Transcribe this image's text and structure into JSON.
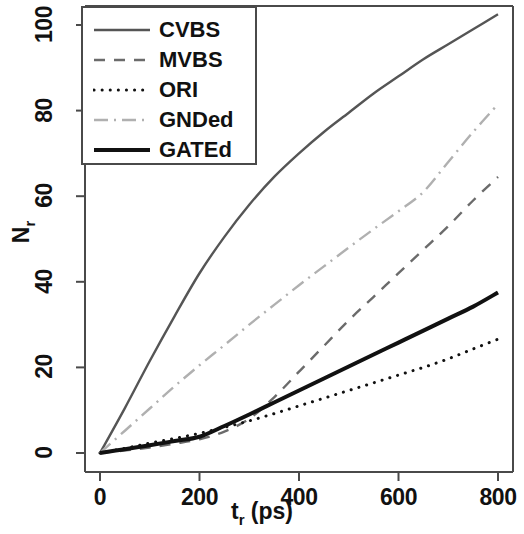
{
  "chart_data": {
    "type": "line",
    "title": "",
    "xlabel": "t_r (ps)",
    "ylabel": "N_r",
    "xlabel_main": "t",
    "xlabel_sub": "r",
    "xlabel_unit": " (ps)",
    "ylabel_main": "N",
    "ylabel_sub": "r",
    "xlim": [
      -30,
      830
    ],
    "ylim": [
      -4,
      106
    ],
    "xticks": [
      0,
      200,
      400,
      600,
      800
    ],
    "yticks": [
      0,
      20,
      40,
      60,
      80,
      100
    ],
    "xtick_labels": [
      "0",
      "200",
      "400",
      "600",
      "800"
    ],
    "ytick_labels": [
      "0",
      "20",
      "40",
      "60",
      "80",
      "100"
    ],
    "grid": false,
    "legend_position": "top-left",
    "x": [
      0,
      50,
      100,
      150,
      200,
      250,
      300,
      350,
      400,
      450,
      500,
      550,
      600,
      650,
      700,
      750,
      800
    ],
    "series": [
      {
        "name": "CVBS",
        "style": "solid-thin",
        "color": "#555555",
        "values": [
          0,
          10.5,
          21.5,
          32.0,
          42.0,
          50.5,
          58.0,
          64.5,
          70.0,
          75.0,
          79.5,
          84.0,
          88.0,
          92.0,
          95.5,
          99.0,
          102.5
        ]
      },
      {
        "name": "MVBS",
        "style": "dashed",
        "color": "#6b6b6b",
        "values": [
          0,
          0.6,
          1.3,
          2.2,
          3.2,
          5.0,
          8.0,
          13.0,
          19.0,
          25.0,
          31.0,
          36.5,
          42.0,
          47.5,
          53.0,
          59.0,
          64.5
        ]
      },
      {
        "name": "ORI",
        "style": "dotted",
        "color": "#111111",
        "values": [
          0,
          1.1,
          2.3,
          3.4,
          4.6,
          6.0,
          7.5,
          9.2,
          11.0,
          12.8,
          14.6,
          16.4,
          18.2,
          20.0,
          22.0,
          24.3,
          26.6
        ]
      },
      {
        "name": "GNDed",
        "style": "dashdot",
        "color": "#b0b0b0",
        "values": [
          0,
          5.2,
          10.4,
          15.6,
          20.5,
          25.2,
          30.0,
          34.6,
          39.2,
          43.6,
          48.0,
          52.3,
          56.5,
          61.0,
          68.0,
          75.0,
          81.5
        ]
      },
      {
        "name": "GATEd",
        "style": "solid-thick",
        "color": "#111111",
        "values": [
          0,
          0.9,
          1.8,
          2.8,
          3.8,
          6.3,
          9.0,
          11.8,
          14.6,
          17.4,
          20.2,
          23.0,
          25.8,
          28.6,
          31.4,
          34.2,
          37.5
        ]
      }
    ]
  },
  "legend": {
    "items": [
      {
        "label": "CVBS"
      },
      {
        "label": "MVBS"
      },
      {
        "label": "ORI"
      },
      {
        "label": "GNDed"
      },
      {
        "label": "GATEd"
      }
    ]
  },
  "axes": {
    "x_tick_labels": [
      "0",
      "200",
      "400",
      "600",
      "800"
    ],
    "y_tick_labels": [
      "0",
      "20",
      "40",
      "60",
      "80",
      "100"
    ]
  }
}
